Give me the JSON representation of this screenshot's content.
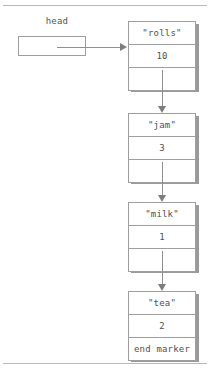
{
  "diagram": {
    "kind": "singly-linked-list",
    "head_label": "head",
    "colors": {
      "border": "#9e9e9e",
      "shadow": "#9a9a9a",
      "arrow": "#8f8f8f",
      "text": "#4f4f4f",
      "rule": "#b9b9b9",
      "background": "#ffffff"
    },
    "nodes": [
      {
        "name": "rolls",
        "value_label": "\"rolls\"",
        "count": "10",
        "pointer_label": ""
      },
      {
        "name": "jam",
        "value_label": "\"jam\"",
        "count": "3",
        "pointer_label": ""
      },
      {
        "name": "milk",
        "value_label": "\"milk\"",
        "count": "1",
        "pointer_label": ""
      },
      {
        "name": "tea",
        "value_label": "\"tea\"",
        "count": "2",
        "pointer_label": "end marker"
      }
    ]
  }
}
